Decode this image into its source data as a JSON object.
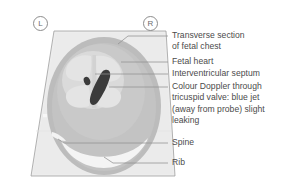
{
  "figure": {
    "orientation_markers": [
      {
        "name": "left-marker",
        "text": "L"
      },
      {
        "name": "right-marker",
        "text": "R"
      }
    ],
    "colors": {
      "sector_outer": "#eeeeee",
      "sector_fill": "#e9e9e9",
      "sector_outline": "#9b9b9b",
      "chest_fill": "#b9b9b9",
      "chest_inner": "#c4c4c4",
      "heart_fill": "#dcdcdc",
      "chamber_fill": "#e3e3e3",
      "doppler_jet": "#3a3a3a",
      "spine": "#f2f2f2",
      "rib": "#f4f4f4",
      "leader_line": "#8f8f8f",
      "text": "#4b4b4b"
    },
    "structures": [
      {
        "name": "transverse-section-of-fetal-chest",
        "label": "Transverse section\nof fetal chest"
      },
      {
        "name": "fetal-heart",
        "label": "Fetal heart"
      },
      {
        "name": "interventricular-septum",
        "label": "Interventricular septum"
      },
      {
        "name": "colour-doppler-tricuspid-jet",
        "label": "Colour Doppler through\ntricuspid valve: blue jet\n(away from probe) slight\nleaking"
      },
      {
        "name": "spine",
        "label": "Spine"
      },
      {
        "name": "rib",
        "label": "Rib"
      }
    ]
  }
}
